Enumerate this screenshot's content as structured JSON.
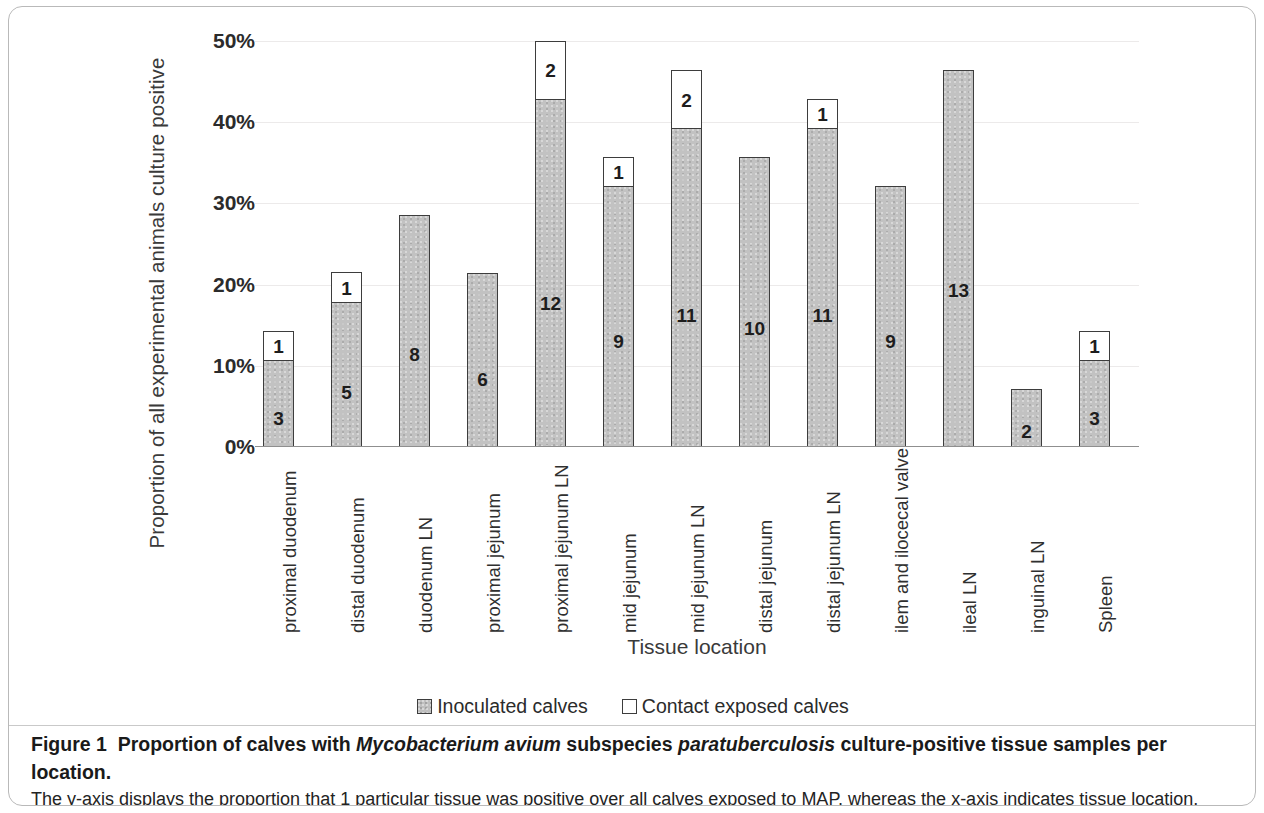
{
  "figure": {
    "y_axis_title": "Proportion of all experimental animals culture  positive",
    "x_axis_title": "Tissue location",
    "legend": [
      {
        "label": "Inoculated calves",
        "swatch": "inoculated-swatch"
      },
      {
        "label": "Contact exposed calves",
        "swatch": "contact-swatch"
      }
    ],
    "caption": {
      "label": "Figure 1",
      "title_part1": "Proportion of calves with ",
      "title_species1": "Mycobacterium avium",
      "title_part2": " subspecies ",
      "title_species2": "paratuberculosis",
      "title_part3": " culture-positive tissue samples per location.",
      "line2": "The y-axis displays the proportion that 1 particular tissue was positive over all calves exposed to MAP, whereas the x-axis indicates tissue location.",
      "line3": "Numbers indicate number of calves with a culture-positive tissue in the particular location. LN, lymph node."
    }
  },
  "chart_data": {
    "type": "bar",
    "stacked": true,
    "title": "Proportion of calves with Mycobacterium avium subspecies paratuberculosis culture-positive tissue samples per location.",
    "xlabel": "Tissue location",
    "ylabel": "Proportion of all experimental animals culture  positive",
    "ylim": [
      0,
      50
    ],
    "yticks": [
      "0%",
      "10%",
      "20%",
      "30%",
      "40%",
      "50%"
    ],
    "ytick_values": [
      0,
      10,
      20,
      30,
      40,
      50
    ],
    "grid": true,
    "legend_position": "bottom-center",
    "categories": [
      "proximal duodenum",
      "distal duodenum",
      "duodenum LN",
      "proximal jejunum",
      "proximal jejunum LN",
      "mid jejunum",
      "mid jejunum LN",
      "distal jejunum",
      "distal jejunum LN",
      "ilem and ilocecal valve",
      "ileal LN",
      "inguinal LN",
      "Spleen"
    ],
    "series": [
      {
        "name": "Inoculated calves",
        "values": [
          10.7,
          17.9,
          28.6,
          21.4,
          42.9,
          32.1,
          39.3,
          35.7,
          39.3,
          32.1,
          46.4,
          7.1,
          10.7
        ],
        "counts": [
          3,
          5,
          8,
          6,
          12,
          9,
          11,
          10,
          11,
          9,
          13,
          2,
          3
        ]
      },
      {
        "name": "Contact exposed calves",
        "values": [
          3.6,
          3.6,
          0,
          0,
          7.1,
          3.6,
          7.1,
          0,
          3.6,
          0,
          0,
          0,
          3.6
        ],
        "counts": [
          1,
          1,
          null,
          null,
          2,
          1,
          2,
          null,
          1,
          null,
          null,
          null,
          1
        ]
      }
    ],
    "bars": [
      {
        "category": "proximal duodenum",
        "inoculated_pct": 10.7,
        "inoculated_count": "3",
        "contact_pct": 3.6,
        "contact_count": "1"
      },
      {
        "category": "distal duodenum",
        "inoculated_pct": 17.9,
        "inoculated_count": "5",
        "contact_pct": 3.6,
        "contact_count": "1"
      },
      {
        "category": "duodenum LN",
        "inoculated_pct": 28.6,
        "inoculated_count": "8",
        "contact_pct": 0,
        "contact_count": ""
      },
      {
        "category": "proximal jejunum",
        "inoculated_pct": 21.4,
        "inoculated_count": "6",
        "contact_pct": 0,
        "contact_count": ""
      },
      {
        "category": "proximal jejunum LN",
        "inoculated_pct": 42.9,
        "inoculated_count": "12",
        "contact_pct": 7.1,
        "contact_count": "2"
      },
      {
        "category": "mid jejunum",
        "inoculated_pct": 32.1,
        "inoculated_count": "9",
        "contact_pct": 3.6,
        "contact_count": "1"
      },
      {
        "category": "mid jejunum LN",
        "inoculated_pct": 39.3,
        "inoculated_count": "11",
        "contact_pct": 7.1,
        "contact_count": "2"
      },
      {
        "category": "distal jejunum",
        "inoculated_pct": 35.7,
        "inoculated_count": "10",
        "contact_pct": 0,
        "contact_count": ""
      },
      {
        "category": "distal jejunum LN",
        "inoculated_pct": 39.3,
        "inoculated_count": "11",
        "contact_pct": 3.6,
        "contact_count": "1"
      },
      {
        "category": "ilem and ilocecal valve",
        "inoculated_pct": 32.1,
        "inoculated_count": "9",
        "contact_pct": 0,
        "contact_count": ""
      },
      {
        "category": "ileal LN",
        "inoculated_pct": 46.4,
        "inoculated_count": "13",
        "contact_pct": 0,
        "contact_count": ""
      },
      {
        "category": "inguinal LN",
        "inoculated_pct": 7.1,
        "inoculated_count": "2",
        "contact_pct": 0,
        "contact_count": ""
      },
      {
        "category": "Spleen",
        "inoculated_pct": 10.7,
        "inoculated_count": "3",
        "contact_pct": 3.6,
        "contact_count": "1"
      }
    ],
    "colors": {
      "inoculated": "#c2c2c2",
      "contact": "#ffffff",
      "bar_outline": "#3d3d3d",
      "gridline": "#eceaea",
      "axis": "#8f8f8f"
    }
  }
}
